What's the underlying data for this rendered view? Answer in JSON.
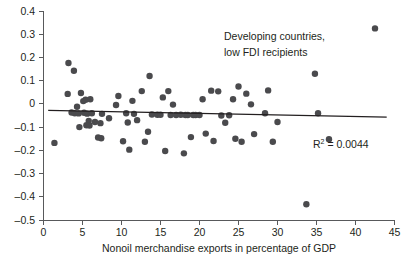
{
  "chart_data": {
    "type": "scatter",
    "title": "",
    "annotation": [
      "Developing countries,",
      "low FDI recipients"
    ],
    "r2_label": "R",
    "r2_superscript": "2",
    "r2_value": "= 0.0044",
    "r2_numeric": 0.0044,
    "xlabel": "Nonoil merchandise exports in percentage of GDP",
    "ylabel": "",
    "xlim": [
      0,
      45
    ],
    "ylim": [
      -0.5,
      0.4
    ],
    "xticks": [
      0,
      5,
      10,
      15,
      20,
      25,
      30,
      35,
      40,
      45
    ],
    "xtick_labels": [
      "0",
      "5",
      "10",
      "15",
      "20",
      "25",
      "30",
      "35",
      "40",
      "45"
    ],
    "yticks": [
      0.4,
      0.3,
      0.2,
      0.1,
      0,
      -0.1,
      -0.2,
      -0.3,
      -0.4,
      -0.5
    ],
    "ytick_labels": [
      "0.4",
      "0.3",
      "0.2",
      "0.1",
      "0",
      "–0.1",
      "–0.2",
      "–0.3",
      "–0.4",
      "–0.5"
    ],
    "grid": false,
    "legend": null,
    "marker_color": "#4a4a4d",
    "marker_size": 3.2,
    "trendline": {
      "x0": 0.6,
      "y0": -0.028,
      "x1": 44.0,
      "y1": -0.057,
      "color": "#231f20"
    },
    "points": [
      {
        "x": 1.4,
        "y": -0.168
      },
      {
        "x": 3.2,
        "y": 0.176
      },
      {
        "x": 3.9,
        "y": 0.143
      },
      {
        "x": 3.1,
        "y": 0.043
      },
      {
        "x": 3.6,
        "y": -0.037
      },
      {
        "x": 4.0,
        "y": -0.04
      },
      {
        "x": 4.3,
        "y": -0.012
      },
      {
        "x": 4.5,
        "y": -0.041
      },
      {
        "x": 4.6,
        "y": -0.1
      },
      {
        "x": 4.8,
        "y": 0.047
      },
      {
        "x": 5.1,
        "y": 0.012
      },
      {
        "x": 5.2,
        "y": -0.038
      },
      {
        "x": 5.4,
        "y": 0.018
      },
      {
        "x": 5.5,
        "y": -0.092
      },
      {
        "x": 5.6,
        "y": -0.042
      },
      {
        "x": 5.8,
        "y": -0.073
      },
      {
        "x": 5.9,
        "y": -0.093
      },
      {
        "x": 6.0,
        "y": 0.02
      },
      {
        "x": 6.2,
        "y": -0.04
      },
      {
        "x": 6.6,
        "y": -0.078
      },
      {
        "x": 7.0,
        "y": -0.145
      },
      {
        "x": 7.3,
        "y": -0.083
      },
      {
        "x": 7.4,
        "y": -0.148
      },
      {
        "x": 7.5,
        "y": -0.043
      },
      {
        "x": 8.4,
        "y": -0.062
      },
      {
        "x": 9.3,
        "y": -0.005
      },
      {
        "x": 9.6,
        "y": 0.034
      },
      {
        "x": 10.2,
        "y": -0.161
      },
      {
        "x": 10.6,
        "y": -0.04
      },
      {
        "x": 10.8,
        "y": -0.08
      },
      {
        "x": 11.0,
        "y": -0.197
      },
      {
        "x": 11.4,
        "y": 0.013
      },
      {
        "x": 11.6,
        "y": -0.043
      },
      {
        "x": 12.0,
        "y": -0.07
      },
      {
        "x": 12.6,
        "y": 0.055
      },
      {
        "x": 13.0,
        "y": -0.163
      },
      {
        "x": 13.4,
        "y": -0.12
      },
      {
        "x": 13.6,
        "y": 0.12
      },
      {
        "x": 13.9,
        "y": -0.046
      },
      {
        "x": 14.6,
        "y": -0.047
      },
      {
        "x": 15.0,
        "y": -0.047
      },
      {
        "x": 15.3,
        "y": 0.028
      },
      {
        "x": 15.6,
        "y": -0.203
      },
      {
        "x": 16.0,
        "y": 0.055
      },
      {
        "x": 16.3,
        "y": -0.048
      },
      {
        "x": 16.6,
        "y": -0.003
      },
      {
        "x": 17.0,
        "y": -0.048
      },
      {
        "x": 17.6,
        "y": -0.047
      },
      {
        "x": 18.0,
        "y": -0.213
      },
      {
        "x": 18.2,
        "y": -0.048
      },
      {
        "x": 18.5,
        "y": -0.048
      },
      {
        "x": 18.9,
        "y": -0.143
      },
      {
        "x": 19.2,
        "y": -0.048
      },
      {
        "x": 19.5,
        "y": -0.048
      },
      {
        "x": 20.0,
        "y": -0.048
      },
      {
        "x": 20.4,
        "y": 0.02
      },
      {
        "x": 20.8,
        "y": -0.128
      },
      {
        "x": 21.5,
        "y": 0.057
      },
      {
        "x": 21.8,
        "y": -0.16
      },
      {
        "x": 22.4,
        "y": 0.054
      },
      {
        "x": 22.8,
        "y": -0.05
      },
      {
        "x": 23.3,
        "y": -0.081
      },
      {
        "x": 23.8,
        "y": -0.049
      },
      {
        "x": 24.3,
        "y": 0.02
      },
      {
        "x": 24.6,
        "y": -0.15
      },
      {
        "x": 25.0,
        "y": 0.075
      },
      {
        "x": 25.4,
        "y": -0.163
      },
      {
        "x": 26.0,
        "y": 0.044
      },
      {
        "x": 26.6,
        "y": -0.002
      },
      {
        "x": 27.0,
        "y": -0.13
      },
      {
        "x": 28.4,
        "y": -0.04
      },
      {
        "x": 28.8,
        "y": 0.058
      },
      {
        "x": 29.4,
        "y": -0.163
      },
      {
        "x": 30.0,
        "y": -0.078
      },
      {
        "x": 33.7,
        "y": -0.432
      },
      {
        "x": 34.8,
        "y": 0.13
      },
      {
        "x": 35.2,
        "y": -0.04
      },
      {
        "x": 36.6,
        "y": -0.152
      },
      {
        "x": 42.5,
        "y": 0.325
      }
    ]
  }
}
